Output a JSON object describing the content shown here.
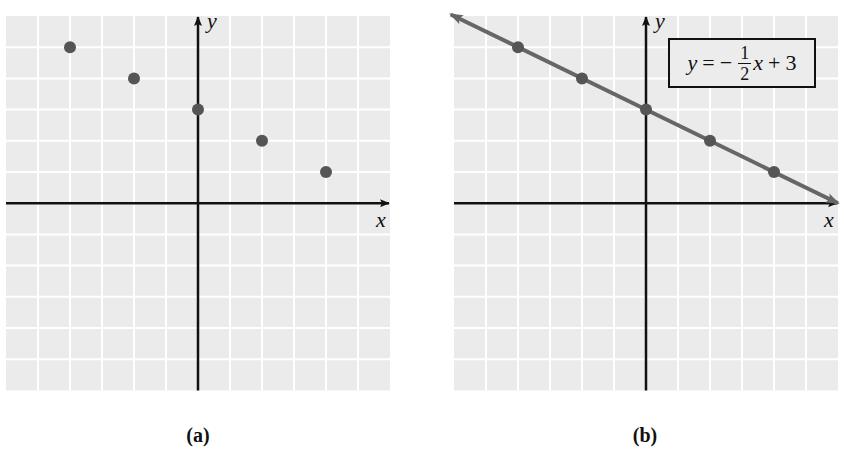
{
  "chart_data": [
    {
      "type": "scatter",
      "panel": "a",
      "title": "",
      "caption": "(a)",
      "xlabel": "x",
      "ylabel": "y",
      "xlim": [
        -6,
        6
      ],
      "ylim": [
        -6,
        6
      ],
      "grid": true,
      "series": [
        {
          "name": "points",
          "x": [
            -4,
            -2,
            0,
            2,
            4
          ],
          "y": [
            5,
            4,
            3,
            2,
            1
          ]
        }
      ]
    },
    {
      "type": "line",
      "panel": "b",
      "title": "",
      "caption": "(b)",
      "xlabel": "x",
      "ylabel": "y",
      "xlim": [
        -6,
        6
      ],
      "ylim": [
        -6,
        6
      ],
      "grid": true,
      "annotation": "y = -1/2 x + 3",
      "series": [
        {
          "name": "points",
          "x": [
            -4,
            -2,
            0,
            2,
            4
          ],
          "y": [
            5,
            4,
            3,
            2,
            1
          ]
        },
        {
          "name": "line",
          "equation": "y = -1/2 x + 3",
          "slope": -0.5,
          "intercept": 3
        }
      ]
    }
  ],
  "panels": {
    "a": {
      "caption": "(a)",
      "xlabel": "x",
      "ylabel": "y"
    },
    "b": {
      "caption": "(b)",
      "xlabel": "x",
      "ylabel": "y",
      "equation": {
        "lhs": "y",
        "eq": "=",
        "minus": "−",
        "num": "1",
        "den": "2",
        "var": "x",
        "plus": "+",
        "const": "3"
      }
    }
  },
  "colors": {
    "grid_bg": "#ebebeb",
    "grid_line": "#ffffff",
    "axis": "#111111",
    "point": "#555555",
    "line": "#666666"
  }
}
